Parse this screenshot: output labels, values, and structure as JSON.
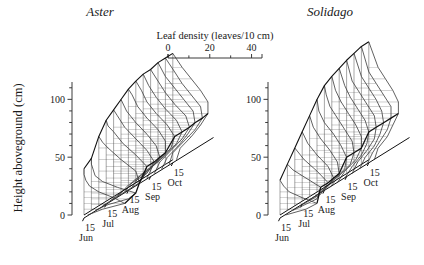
{
  "figure": {
    "background": "#ffffff",
    "line_color": "#3a3a3a",
    "accent_color": "#111111",
    "width": 424,
    "height": 265
  },
  "y_axis": {
    "label": "Height aboveground (cm)",
    "ticks": [
      0,
      50,
      100
    ],
    "tick_labels": [
      "0",
      "50",
      "100"
    ],
    "minor_step": 10,
    "range": [
      0,
      115
    ]
  },
  "density_axis": {
    "label": "Leaf density (leaves/10 cm)",
    "ticks": [
      0,
      20,
      40
    ],
    "tick_labels": [
      "0",
      "20",
      "40"
    ],
    "minor_ticks": [
      10,
      30
    ],
    "range": [
      0,
      45
    ]
  },
  "date_axis": {
    "labels": [
      {
        "day": "15",
        "month": "Jun"
      },
      {
        "day": "15",
        "month": "Jul"
      },
      {
        "day": "15",
        "month": "Aug"
      },
      {
        "day": "15",
        "month": "Sep"
      },
      {
        "day": "15",
        "month": "Oct"
      }
    ]
  },
  "panels": [
    {
      "name": "aster",
      "title": "Aster"
    },
    {
      "name": "solidago",
      "title": "Solidago"
    }
  ],
  "chart_data": {
    "type": "line",
    "title": "",
    "xlabel": "Leaf density (leaves/10 cm)",
    "ylabel": "Height aboveground (cm)",
    "zlabel": "Date",
    "xlim": [
      0,
      45
    ],
    "ylim": [
      0,
      115
    ],
    "grid": false,
    "legend_position": "none",
    "panels": [
      {
        "name": "Aster",
        "dates": [
          "15 Jun",
          "25 Jun",
          "5 Jul",
          "15 Jul",
          "25 Jul",
          "5 Aug",
          "15 Aug",
          "25 Aug",
          "5 Sep",
          "15 Sep",
          "25 Sep",
          "5 Oct",
          "15 Oct"
        ],
        "profiles": [
          {
            "date": "15 Jun",
            "heights": [
              0,
              5,
              10,
              15,
              20,
              25,
              30,
              35,
              40
            ],
            "density": [
              2,
              10,
              22,
              16,
              8,
              3,
              1,
              0,
              0
            ]
          },
          {
            "date": "25 Jun",
            "heights": [
              0,
              5,
              10,
              15,
              20,
              25,
              30,
              35,
              40,
              45
            ],
            "density": [
              2,
              9,
              20,
              24,
              14,
              6,
              2,
              1,
              0,
              0
            ]
          },
          {
            "date": "5 Jul",
            "heights": [
              0,
              10,
              20,
              30,
              40,
              50,
              55,
              60
            ],
            "density": [
              2,
              12,
              22,
              20,
              12,
              5,
              2,
              0
            ]
          },
          {
            "date": "15 Jul",
            "heights": [
              0,
              10,
              20,
              30,
              40,
              50,
              60,
              65,
              70
            ],
            "density": [
              2,
              10,
              20,
              22,
              16,
              9,
              4,
              1,
              0
            ]
          },
          {
            "date": "25 Jul",
            "heights": [
              0,
              10,
              20,
              30,
              40,
              50,
              60,
              70,
              75
            ],
            "density": [
              2,
              8,
              18,
              22,
              18,
              12,
              6,
              2,
              0
            ]
          },
          {
            "date": "5 Aug",
            "heights": [
              0,
              10,
              20,
              30,
              40,
              50,
              60,
              70,
              80
            ],
            "density": [
              2,
              7,
              16,
              21,
              19,
              14,
              8,
              3,
              0
            ]
          },
          {
            "date": "15 Aug",
            "heights": [
              0,
              10,
              20,
              30,
              40,
              50,
              60,
              70,
              80,
              85
            ],
            "density": [
              2,
              6,
              14,
              20,
              20,
              16,
              10,
              5,
              2,
              0
            ]
          },
          {
            "date": "25 Aug",
            "heights": [
              0,
              10,
              20,
              30,
              40,
              50,
              60,
              70,
              80,
              88
            ],
            "density": [
              2,
              6,
              13,
              19,
              21,
              17,
              11,
              6,
              3,
              0
            ]
          },
          {
            "date": "5 Sep",
            "heights": [
              0,
              10,
              20,
              30,
              40,
              50,
              60,
              70,
              80,
              90
            ],
            "density": [
              2,
              5,
              12,
              18,
              21,
              18,
              12,
              7,
              3,
              0
            ]
          },
          {
            "date": "15 Sep",
            "heights": [
              0,
              10,
              20,
              30,
              40,
              50,
              60,
              70,
              80,
              90
            ],
            "density": [
              2,
              5,
              11,
              17,
              21,
              19,
              13,
              8,
              4,
              0
            ]
          },
          {
            "date": "25 Sep",
            "heights": [
              0,
              10,
              20,
              30,
              40,
              50,
              60,
              70,
              80,
              92
            ],
            "density": [
              2,
              5,
              11,
              16,
              20,
              19,
              14,
              9,
              4,
              0
            ]
          },
          {
            "date": "5 Oct",
            "heights": [
              0,
              10,
              20,
              30,
              40,
              50,
              60,
              70,
              80,
              92
            ],
            "density": [
              2,
              4,
              10,
              16,
              20,
              19,
              14,
              9,
              5,
              0
            ]
          },
          {
            "date": "15 Oct",
            "heights": [
              0,
              10,
              20,
              30,
              40,
              50,
              60,
              70,
              80,
              92
            ],
            "density": [
              2,
              4,
              10,
              15,
              19,
              19,
              15,
              10,
              5,
              0
            ]
          }
        ],
        "trajectory_note": "Dark lines trace the seasonal rise of canopy top and of the density mode."
      },
      {
        "name": "Solidago",
        "dates": [
          "15 Jun",
          "25 Jun",
          "5 Jul",
          "15 Jul",
          "25 Jul",
          "5 Aug",
          "15 Aug",
          "25 Aug",
          "5 Sep",
          "15 Sep",
          "25 Sep",
          "5 Oct",
          "15 Oct"
        ],
        "profiles": [
          {
            "date": "15 Jun",
            "heights": [
              0,
              5,
              10,
              15,
              20,
              25,
              30
            ],
            "density": [
              3,
              14,
              20,
              12,
              5,
              2,
              0
            ]
          },
          {
            "date": "25 Jun",
            "heights": [
              0,
              10,
              20,
              30,
              35,
              40
            ],
            "density": [
              3,
              16,
              18,
              8,
              3,
              0
            ]
          },
          {
            "date": "5 Jul",
            "heights": [
              0,
              10,
              20,
              30,
              40,
              50
            ],
            "density": [
              3,
              14,
              18,
              12,
              5,
              0
            ]
          },
          {
            "date": "15 Jul",
            "heights": [
              0,
              10,
              20,
              30,
              40,
              50,
              60
            ],
            "density": [
              3,
              12,
              17,
              14,
              8,
              3,
              0
            ]
          },
          {
            "date": "25 Jul",
            "heights": [
              0,
              10,
              20,
              30,
              40,
              50,
              60,
              70
            ],
            "density": [
              3,
              10,
              16,
              15,
              11,
              6,
              2,
              0
            ]
          },
          {
            "date": "5 Aug",
            "heights": [
              0,
              10,
              20,
              30,
              40,
              50,
              60,
              70,
              80
            ],
            "density": [
              3,
              9,
              15,
              16,
              13,
              9,
              4,
              1,
              0
            ]
          },
          {
            "date": "15 Aug",
            "heights": [
              0,
              10,
              20,
              30,
              40,
              50,
              60,
              70,
              80,
              88
            ],
            "density": [
              3,
              8,
              14,
              16,
              15,
              11,
              7,
              3,
              1,
              0
            ]
          },
          {
            "date": "25 Aug",
            "heights": [
              0,
              10,
              20,
              30,
              40,
              50,
              60,
              70,
              80,
              92
            ],
            "density": [
              3,
              7,
              13,
              16,
              16,
              13,
              9,
              5,
              2,
              0
            ]
          },
          {
            "date": "5 Sep",
            "heights": [
              0,
              10,
              20,
              30,
              40,
              50,
              60,
              70,
              80,
              95
            ],
            "density": [
              3,
              7,
              12,
              15,
              16,
              14,
              10,
              6,
              3,
              0
            ]
          },
          {
            "date": "15 Sep",
            "heights": [
              0,
              10,
              20,
              30,
              40,
              50,
              60,
              70,
              80,
              98
            ],
            "density": [
              3,
              6,
              11,
              15,
              16,
              15,
              11,
              7,
              3,
              0
            ]
          },
          {
            "date": "25 Sep",
            "heights": [
              0,
              10,
              20,
              30,
              40,
              50,
              60,
              70,
              80,
              100
            ],
            "density": [
              3,
              6,
              11,
              14,
              16,
              15,
              12,
              8,
              4,
              0
            ]
          },
          {
            "date": "5 Oct",
            "heights": [
              0,
              10,
              20,
              30,
              40,
              50,
              60,
              70,
              80,
              102
            ],
            "density": [
              3,
              6,
              10,
              14,
              16,
              16,
              12,
              8,
              4,
              0
            ]
          },
          {
            "date": "15 Oct",
            "heights": [
              0,
              10,
              20,
              30,
              40,
              50,
              60,
              70,
              80,
              102
            ],
            "density": [
              3,
              5,
              10,
              13,
              16,
              16,
              13,
              9,
              5,
              0
            ]
          }
        ],
        "trajectory_note": "Dark lines trace the seasonal rise of canopy top and of the density mode."
      }
    ]
  }
}
